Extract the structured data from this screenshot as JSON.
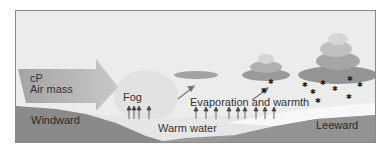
{
  "diagram": {
    "labels": {
      "air_mass_line1": "cP",
      "air_mass_line2": "Air mass",
      "fog": "Fog",
      "evaporation": "Evaporation and warmth",
      "warm_water": "Warm water",
      "windward": "Windward",
      "leeward": "Leeward"
    },
    "colors": {
      "sky": "#ececec",
      "land": "#8c8c8c",
      "water": "#e4e4e4",
      "arrow": "#a8a8a8",
      "cloud": "#9a9a9a",
      "snow": "#222222"
    }
  }
}
